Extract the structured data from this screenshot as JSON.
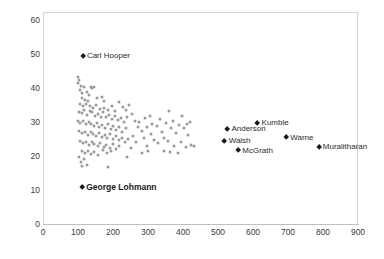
{
  "chart_data": {
    "type": "scatter",
    "title": "",
    "subtitle": "",
    "xlabel": "",
    "ylabel": "",
    "xlim": [
      0,
      950
    ],
    "ylim": [
      0,
      63
    ],
    "grid": false,
    "legend": false,
    "xticks": [
      0,
      100,
      200,
      300,
      400,
      500,
      600,
      700,
      800,
      900
    ],
    "yticks": [
      0,
      10,
      20,
      30,
      40,
      50,
      60
    ],
    "point_color": "#9a9a9a",
    "highlight_color": "#1a1a1a",
    "axis_color": "#bfbfbf",
    "frame_color": "#d6d6d6",
    "highlights": [
      {
        "label": "Carl Hooper",
        "x": 114,
        "y": 49.4,
        "label_side": "right",
        "bold": false
      },
      {
        "label": "George Lohmann",
        "x": 112,
        "y": 10.8,
        "label_side": "right",
        "bold": true
      },
      {
        "label": "Kumble",
        "x": 613,
        "y": 29.6,
        "label_side": "right",
        "bold": false
      },
      {
        "label": "Anderson",
        "x": 527,
        "y": 28.0,
        "label_side": "right",
        "bold": false
      },
      {
        "label": "Warne",
        "x": 695,
        "y": 25.4,
        "label_side": "right",
        "bold": false
      },
      {
        "label": "Walsh",
        "x": 519,
        "y": 24.4,
        "label_side": "right",
        "bold": false
      },
      {
        "label": "McGrath",
        "x": 558,
        "y": 21.6,
        "label_side": "right",
        "bold": false
      },
      {
        "label": "Muralitharan",
        "x": 788,
        "y": 22.7,
        "label_side": "right",
        "bold": false
      }
    ],
    "points": [
      {
        "x": 100,
        "y": 43.2
      },
      {
        "x": 103,
        "y": 42.3
      },
      {
        "x": 100,
        "y": 41.6
      },
      {
        "x": 108,
        "y": 40.6
      },
      {
        "x": 106,
        "y": 39.3
      },
      {
        "x": 117,
        "y": 40.4
      },
      {
        "x": 136,
        "y": 40.2
      },
      {
        "x": 141,
        "y": 40.1
      },
      {
        "x": 147,
        "y": 40.3
      },
      {
        "x": 112,
        "y": 38.4
      },
      {
        "x": 126,
        "y": 38.7
      },
      {
        "x": 131,
        "y": 37.9
      },
      {
        "x": 110,
        "y": 37.2
      },
      {
        "x": 120,
        "y": 36.4
      },
      {
        "x": 128,
        "y": 36.2
      },
      {
        "x": 155,
        "y": 37.0
      },
      {
        "x": 168,
        "y": 37.5
      },
      {
        "x": 175,
        "y": 36.3
      },
      {
        "x": 107,
        "y": 35.2
      },
      {
        "x": 114,
        "y": 34.8
      },
      {
        "x": 122,
        "y": 35.4
      },
      {
        "x": 135,
        "y": 34.6
      },
      {
        "x": 143,
        "y": 34.1
      },
      {
        "x": 152,
        "y": 34.9
      },
      {
        "x": 163,
        "y": 33.8
      },
      {
        "x": 174,
        "y": 34.2
      },
      {
        "x": 186,
        "y": 33.5
      },
      {
        "x": 198,
        "y": 34.7
      },
      {
        "x": 207,
        "y": 33.1
      },
      {
        "x": 216,
        "y": 35.8
      },
      {
        "x": 228,
        "y": 34.3
      },
      {
        "x": 238,
        "y": 33.6
      },
      {
        "x": 246,
        "y": 35.1
      },
      {
        "x": 102,
        "y": 33.0
      },
      {
        "x": 110,
        "y": 32.6
      },
      {
        "x": 118,
        "y": 33.4
      },
      {
        "x": 125,
        "y": 32.2
      },
      {
        "x": 133,
        "y": 33.1
      },
      {
        "x": 140,
        "y": 32.8
      },
      {
        "x": 148,
        "y": 31.9
      },
      {
        "x": 157,
        "y": 32.5
      },
      {
        "x": 165,
        "y": 31.6
      },
      {
        "x": 172,
        "y": 32.9
      },
      {
        "x": 180,
        "y": 31.4
      },
      {
        "x": 189,
        "y": 32.1
      },
      {
        "x": 197,
        "y": 30.8
      },
      {
        "x": 205,
        "y": 31.7
      },
      {
        "x": 213,
        "y": 30.5
      },
      {
        "x": 222,
        "y": 31.2
      },
      {
        "x": 231,
        "y": 30.1
      },
      {
        "x": 240,
        "y": 31.5
      },
      {
        "x": 100,
        "y": 30.4
      },
      {
        "x": 107,
        "y": 29.8
      },
      {
        "x": 115,
        "y": 30.2
      },
      {
        "x": 122,
        "y": 29.3
      },
      {
        "x": 130,
        "y": 30.0
      },
      {
        "x": 138,
        "y": 29.5
      },
      {
        "x": 145,
        "y": 28.9
      },
      {
        "x": 153,
        "y": 29.7
      },
      {
        "x": 161,
        "y": 28.6
      },
      {
        "x": 169,
        "y": 29.1
      },
      {
        "x": 177,
        "y": 28.3
      },
      {
        "x": 185,
        "y": 29.4
      },
      {
        "x": 193,
        "y": 28.0
      },
      {
        "x": 201,
        "y": 28.8
      },
      {
        "x": 209,
        "y": 27.6
      },
      {
        "x": 218,
        "y": 28.4
      },
      {
        "x": 227,
        "y": 27.2
      },
      {
        "x": 236,
        "y": 28.1
      },
      {
        "x": 104,
        "y": 27.4
      },
      {
        "x": 112,
        "y": 26.8
      },
      {
        "x": 120,
        "y": 27.1
      },
      {
        "x": 128,
        "y": 26.3
      },
      {
        "x": 136,
        "y": 27.0
      },
      {
        "x": 144,
        "y": 26.5
      },
      {
        "x": 152,
        "y": 25.9
      },
      {
        "x": 160,
        "y": 26.7
      },
      {
        "x": 168,
        "y": 25.6
      },
      {
        "x": 176,
        "y": 26.1
      },
      {
        "x": 184,
        "y": 25.3
      },
      {
        "x": 192,
        "y": 26.4
      },
      {
        "x": 200,
        "y": 25.0
      },
      {
        "x": 208,
        "y": 25.8
      },
      {
        "x": 217,
        "y": 24.6
      },
      {
        "x": 226,
        "y": 25.4
      },
      {
        "x": 235,
        "y": 24.2
      },
      {
        "x": 244,
        "y": 25.1
      },
      {
        "x": 106,
        "y": 24.4
      },
      {
        "x": 114,
        "y": 23.8
      },
      {
        "x": 123,
        "y": 24.1
      },
      {
        "x": 131,
        "y": 23.3
      },
      {
        "x": 139,
        "y": 24.0
      },
      {
        "x": 147,
        "y": 23.5
      },
      {
        "x": 156,
        "y": 22.9
      },
      {
        "x": 164,
        "y": 23.7
      },
      {
        "x": 173,
        "y": 22.6
      },
      {
        "x": 181,
        "y": 23.1
      },
      {
        "x": 190,
        "y": 22.3
      },
      {
        "x": 199,
        "y": 23.4
      },
      {
        "x": 208,
        "y": 22.0
      },
      {
        "x": 217,
        "y": 22.8
      },
      {
        "x": 110,
        "y": 21.6
      },
      {
        "x": 119,
        "y": 21.0
      },
      {
        "x": 128,
        "y": 21.4
      },
      {
        "x": 137,
        "y": 20.6
      },
      {
        "x": 146,
        "y": 21.2
      },
      {
        "x": 158,
        "y": 20.4
      },
      {
        "x": 170,
        "y": 21.8
      },
      {
        "x": 182,
        "y": 20.9
      },
      {
        "x": 194,
        "y": 21.5
      },
      {
        "x": 103,
        "y": 19.6
      },
      {
        "x": 108,
        "y": 18.3
      },
      {
        "x": 112,
        "y": 17.2
      },
      {
        "x": 126,
        "y": 17.5
      },
      {
        "x": 118,
        "y": 19.0
      },
      {
        "x": 185,
        "y": 16.8
      },
      {
        "x": 255,
        "y": 32.4
      },
      {
        "x": 263,
        "y": 30.2
      },
      {
        "x": 271,
        "y": 28.6
      },
      {
        "x": 258,
        "y": 26.0
      },
      {
        "x": 266,
        "y": 24.2
      },
      {
        "x": 252,
        "y": 22.4
      },
      {
        "x": 275,
        "y": 29.9
      },
      {
        "x": 284,
        "y": 27.3
      },
      {
        "x": 292,
        "y": 31.1
      },
      {
        "x": 298,
        "y": 28.4
      },
      {
        "x": 288,
        "y": 25.2
      },
      {
        "x": 296,
        "y": 23.0
      },
      {
        "x": 305,
        "y": 31.9
      },
      {
        "x": 312,
        "y": 29.3
      },
      {
        "x": 308,
        "y": 26.6
      },
      {
        "x": 318,
        "y": 24.8
      },
      {
        "x": 325,
        "y": 28.8
      },
      {
        "x": 333,
        "y": 31.0
      },
      {
        "x": 340,
        "y": 27.0
      },
      {
        "x": 329,
        "y": 23.9
      },
      {
        "x": 345,
        "y": 25.2
      },
      {
        "x": 352,
        "y": 29.6
      },
      {
        "x": 360,
        "y": 33.1
      },
      {
        "x": 366,
        "y": 28.2
      },
      {
        "x": 358,
        "y": 24.4
      },
      {
        "x": 372,
        "y": 30.4
      },
      {
        "x": 380,
        "y": 26.8
      },
      {
        "x": 388,
        "y": 29.0
      },
      {
        "x": 375,
        "y": 22.9
      },
      {
        "x": 396,
        "y": 31.8
      },
      {
        "x": 402,
        "y": 28.3
      },
      {
        "x": 394,
        "y": 24.0
      },
      {
        "x": 410,
        "y": 29.5
      },
      {
        "x": 415,
        "y": 26.1
      },
      {
        "x": 408,
        "y": 22.6
      },
      {
        "x": 420,
        "y": 30.0
      },
      {
        "x": 424,
        "y": 23.2
      },
      {
        "x": 430,
        "y": 22.8
      },
      {
        "x": 346,
        "y": 21.6
      },
      {
        "x": 386,
        "y": 21.0
      },
      {
        "x": 364,
        "y": 21.3
      },
      {
        "x": 300,
        "y": 21.4
      },
      {
        "x": 282,
        "y": 20.9
      },
      {
        "x": 240,
        "y": 19.8
      }
    ]
  }
}
